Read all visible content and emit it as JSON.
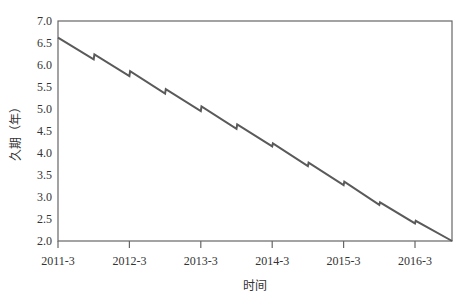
{
  "chart_data": {
    "type": "line",
    "title": "",
    "xlabel": "时间",
    "ylabel": "久期（年）",
    "ylim": [
      2.0,
      7.0
    ],
    "yticks": [
      2.0,
      2.5,
      3.0,
      3.5,
      4.0,
      4.5,
      5.0,
      5.5,
      6.0,
      6.5,
      7.0
    ],
    "ytick_labels": [
      "2.0",
      "2.5",
      "3.0",
      "3.5",
      "4.0",
      "4.5",
      "5.0",
      "5.5",
      "6.0",
      "6.5",
      "7.0"
    ],
    "xtick_labels": [
      "2011-3",
      "2012-3",
      "2013-3",
      "2014-3",
      "2015-3",
      "2016-3"
    ],
    "xlim_years": [
      0,
      5.52
    ],
    "grid": false,
    "legend": null,
    "line_color": "#5a5a5a",
    "series": [
      {
        "name": "久期",
        "points": [
          {
            "t": 0.0,
            "v": 6.62
          },
          {
            "t": 0.5,
            "v": 6.13
          },
          {
            "t": 0.51,
            "v": 6.24
          },
          {
            "t": 1.0,
            "v": 5.75
          },
          {
            "t": 1.01,
            "v": 5.86
          },
          {
            "t": 1.5,
            "v": 5.35
          },
          {
            "t": 1.51,
            "v": 5.45
          },
          {
            "t": 2.0,
            "v": 4.95
          },
          {
            "t": 2.01,
            "v": 5.06
          },
          {
            "t": 2.5,
            "v": 4.55
          },
          {
            "t": 2.51,
            "v": 4.65
          },
          {
            "t": 3.0,
            "v": 4.15
          },
          {
            "t": 3.01,
            "v": 4.22
          },
          {
            "t": 3.5,
            "v": 3.7
          },
          {
            "t": 3.51,
            "v": 3.78
          },
          {
            "t": 4.0,
            "v": 3.27
          },
          {
            "t": 4.01,
            "v": 3.35
          },
          {
            "t": 4.5,
            "v": 2.82
          },
          {
            "t": 4.51,
            "v": 2.88
          },
          {
            "t": 5.0,
            "v": 2.4
          },
          {
            "t": 5.01,
            "v": 2.46
          },
          {
            "t": 5.52,
            "v": 2.0
          }
        ]
      }
    ]
  },
  "labels": {
    "xlabel": "时间",
    "ylabel": "久期（年）"
  }
}
